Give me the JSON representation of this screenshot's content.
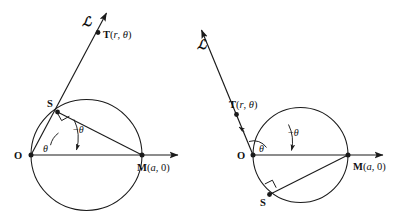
{
  "figure": {
    "stroke_color": "#1a1a1a",
    "background_color": "#ffffff",
    "panels": [
      {
        "id": "left",
        "description": "Ray L directed up-right; point S on upper-left of circle; angle theta above positive x-axis",
        "labels": {
          "ray": "ℒ",
          "point_t": "T(r, θ)",
          "point_s": "S",
          "point_o": "O",
          "point_m": "M(a, 0)",
          "angle_inner": "θ",
          "angle_outer": "−θ"
        }
      },
      {
        "id": "right",
        "description": "Ray L directed up-left; point S on lower-left of circle; angle theta above positive x-axis",
        "labels": {
          "ray": "ℒ",
          "point_t": "T(r, θ)",
          "point_s": "S",
          "point_o": "O",
          "point_m": "M(a, 0)",
          "angle_inner": "θ",
          "angle_outer": "−θ"
        }
      }
    ]
  }
}
